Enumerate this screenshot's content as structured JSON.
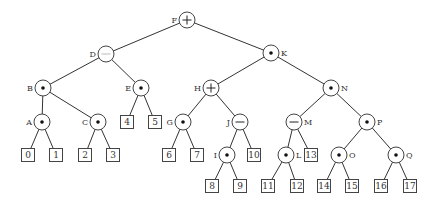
{
  "diagram": {
    "type": "expression-tree",
    "internal_nodes": [
      {
        "id": "F",
        "op": "+",
        "x": 187,
        "y": 20,
        "label_side": "left",
        "parent": null
      },
      {
        "id": "D",
        "op": "−",
        "x": 106,
        "y": 54,
        "label_side": "left",
        "parent": "F",
        "faint": true
      },
      {
        "id": "K",
        "op": "•",
        "x": 271,
        "y": 53,
        "label_side": "right",
        "parent": "F"
      },
      {
        "id": "B",
        "op": "•",
        "x": 43,
        "y": 88,
        "label_side": "left",
        "parent": "D"
      },
      {
        "id": "E",
        "op": "•",
        "x": 141,
        "y": 88,
        "label_side": "left",
        "parent": "D"
      },
      {
        "id": "H",
        "op": "+",
        "x": 211,
        "y": 88,
        "label_side": "left",
        "parent": "K"
      },
      {
        "id": "N",
        "op": "•",
        "x": 331,
        "y": 88,
        "label_side": "right",
        "parent": "K"
      },
      {
        "id": "A",
        "op": "•",
        "x": 42,
        "y": 122,
        "label_side": "left",
        "parent": "B"
      },
      {
        "id": "C",
        "op": "•",
        "x": 98,
        "y": 122,
        "label_side": "left",
        "parent": "B"
      },
      {
        "id": "G",
        "op": "•",
        "x": 183,
        "y": 122,
        "label_side": "left",
        "parent": "H"
      },
      {
        "id": "J",
        "op": "−",
        "x": 240,
        "y": 122,
        "label_side": "left",
        "parent": "H"
      },
      {
        "id": "M",
        "op": "−",
        "x": 294,
        "y": 122,
        "label_side": "right",
        "parent": "N"
      },
      {
        "id": "P",
        "op": "•",
        "x": 367,
        "y": 122,
        "label_side": "right",
        "parent": "N"
      },
      {
        "id": "I",
        "op": "•",
        "x": 227,
        "y": 155,
        "label_side": "left",
        "parent": "J"
      },
      {
        "id": "L",
        "op": "•",
        "x": 286,
        "y": 155,
        "label_side": "right",
        "parent": "M"
      },
      {
        "id": "O",
        "op": "•",
        "x": 339,
        "y": 155,
        "label_side": "right",
        "parent": "P"
      },
      {
        "id": "Q",
        "op": "•",
        "x": 396,
        "y": 155,
        "label_side": "right",
        "parent": "P"
      }
    ],
    "leaves": [
      {
        "value": "0",
        "x": 28,
        "y": 155,
        "parent": "A"
      },
      {
        "value": "1",
        "x": 56,
        "y": 155,
        "parent": "A"
      },
      {
        "value": "2",
        "x": 85,
        "y": 155,
        "parent": "C"
      },
      {
        "value": "3",
        "x": 113,
        "y": 155,
        "parent": "C"
      },
      {
        "value": "4",
        "x": 127,
        "y": 122,
        "parent": "E"
      },
      {
        "value": "5",
        "x": 155,
        "y": 122,
        "parent": "E"
      },
      {
        "value": "6",
        "x": 169,
        "y": 155,
        "parent": "G"
      },
      {
        "value": "7",
        "x": 197,
        "y": 155,
        "parent": "G"
      },
      {
        "value": "8",
        "x": 212,
        "y": 186,
        "parent": "I"
      },
      {
        "value": "9",
        "x": 240,
        "y": 186,
        "parent": "I"
      },
      {
        "value": "10",
        "x": 254,
        "y": 155,
        "parent": "J"
      },
      {
        "value": "11",
        "x": 268,
        "y": 186,
        "parent": "L"
      },
      {
        "value": "12",
        "x": 297,
        "y": 186,
        "parent": "L"
      },
      {
        "value": "13",
        "x": 311,
        "y": 155,
        "parent": "M"
      },
      {
        "value": "14",
        "x": 324,
        "y": 186,
        "parent": "O"
      },
      {
        "value": "15",
        "x": 352,
        "y": 186,
        "parent": "O"
      },
      {
        "value": "16",
        "x": 381,
        "y": 186,
        "parent": "Q"
      },
      {
        "value": "17",
        "x": 410,
        "y": 186,
        "parent": "Q"
      }
    ]
  }
}
